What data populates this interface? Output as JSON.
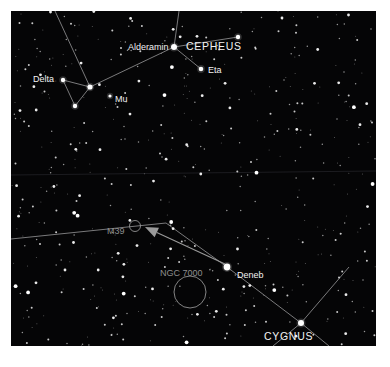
{
  "chart_data": {
    "type": "scatter",
    "title": "",
    "background_color": "#050506",
    "frame_color": "#ffffff",
    "field": {
      "width": 365,
      "height": 335
    },
    "labels": [
      {
        "text": "Alderamin",
        "x": 117,
        "y": 32,
        "kind": "star-name",
        "color": "#f2f2f2"
      },
      {
        "text": "CEPHEUS",
        "x": 175,
        "y": 30,
        "kind": "constellation-name",
        "color": "#f4f4f4"
      },
      {
        "text": "Eta",
        "x": 197,
        "y": 55,
        "kind": "star-name",
        "color": "#f2f2f2"
      },
      {
        "text": "Delta",
        "x": 22,
        "y": 64,
        "kind": "star-name",
        "color": "#f2f2f2"
      },
      {
        "text": "Mu",
        "x": 104,
        "y": 84,
        "kind": "star-name",
        "color": "#f2f2f2"
      },
      {
        "text": "M39",
        "x": 96,
        "y": 216,
        "kind": "dso-name",
        "color": "#8e8e8e"
      },
      {
        "text": "NGC 7000",
        "x": 149,
        "y": 258,
        "kind": "dso-name",
        "color": "#8e8e8e"
      },
      {
        "text": "Deneb",
        "x": 226,
        "y": 260,
        "kind": "star-name",
        "color": "#f2f2f2"
      },
      {
        "text": "CYGNUS",
        "x": 253,
        "y": 320,
        "kind": "constellation-name",
        "color": "#f4f4f4"
      }
    ],
    "named_stars": [
      {
        "name": "Alderamin",
        "x": 163,
        "y": 36,
        "magnitude": 2.5,
        "radius": 3.0
      },
      {
        "name": "Eta",
        "x": 190,
        "y": 58,
        "magnitude": 3.4,
        "radius": 2.3
      },
      {
        "name": "Delta",
        "x": 52,
        "y": 69,
        "magnitude": 3.8,
        "radius": 2.2
      },
      {
        "name": "Mu",
        "x": 99,
        "y": 85,
        "magnitude": 4.1,
        "radius": 1.6
      },
      {
        "name": "Deneb",
        "x": 216,
        "y": 256,
        "magnitude": 1.25,
        "radius": 3.4
      },
      {
        "name": "Zeta",
        "x": 227,
        "y": 26,
        "magnitude": 3.4,
        "radius": 2.2
      },
      {
        "name": "Cygnus-node",
        "x": 290,
        "y": 312,
        "magnitude": 2.9,
        "radius": 3.0
      },
      {
        "name": "Cep-junction",
        "x": 79,
        "y": 76,
        "magnitude": 3.2,
        "radius": 2.6
      },
      {
        "name": "Cep-lower",
        "x": 64,
        "y": 95,
        "magnitude": 3.9,
        "radius": 2.2
      }
    ],
    "constellation_lines": [
      {
        "from": [
          163,
          36
        ],
        "to": [
          79,
          76
        ]
      },
      {
        "from": [
          163,
          36
        ],
        "to": [
          190,
          58
        ]
      },
      {
        "from": [
          163,
          36
        ],
        "to": [
          227,
          26
        ]
      },
      {
        "from": [
          163,
          36
        ],
        "to": [
          168,
          0
        ]
      },
      {
        "from": [
          79,
          76
        ],
        "to": [
          52,
          69
        ]
      },
      {
        "from": [
          79,
          76
        ],
        "to": [
          64,
          95
        ]
      },
      {
        "from": [
          52,
          69
        ],
        "to": [
          64,
          95
        ]
      },
      {
        "from": [
          79,
          76
        ],
        "to": [
          44,
          0
        ]
      },
      {
        "from": [
          290,
          312
        ],
        "to": [
          216,
          256
        ]
      },
      {
        "from": [
          290,
          312
        ],
        "to": [
          338,
          256
        ]
      },
      {
        "from": [
          290,
          312
        ],
        "to": [
          262,
          335
        ]
      },
      {
        "from": [
          290,
          312
        ],
        "to": [
          318,
          335
        ]
      },
      {
        "from": [
          216,
          256
        ],
        "to": [
          155,
          212
        ]
      },
      {
        "from": [
          155,
          212
        ],
        "to": [
          0,
          228
        ]
      }
    ],
    "deep_sky_objects": [
      {
        "name": "M39",
        "type": "open-cluster",
        "x": 124,
        "y": 215,
        "radius": 5.5
      },
      {
        "name": "NGC 7000",
        "type": "nebula",
        "x": 179,
        "y": 281,
        "radius": 16
      }
    ],
    "annotations": [
      {
        "type": "arrow",
        "label": "arrow-to-m39",
        "from": [
          214,
          253
        ],
        "to": [
          134,
          216
        ],
        "color": "#9a9a9a"
      }
    ],
    "grid": {
      "visible": true,
      "lines": [
        {
          "orientation": "horizontal",
          "y": 164,
          "color": "#1c1c20"
        }
      ]
    },
    "legend": {
      "visible": false
    },
    "axes": {
      "visible": false
    }
  }
}
